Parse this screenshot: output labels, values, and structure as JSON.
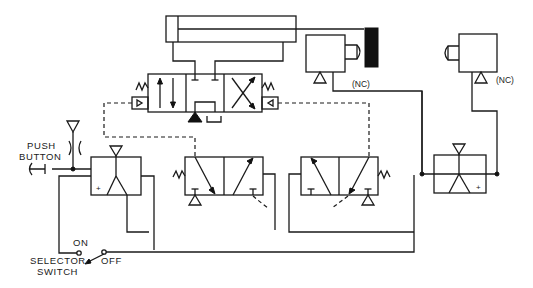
{
  "diagram": {
    "type": "pneumatic-logic-circuit",
    "colors": {
      "line": "#1a1a1a",
      "background": "#ffffff"
    },
    "labels": {
      "push_button_line1": "PUSH",
      "push_button_line2": "BUTTON",
      "selector_line1": "SELECTOR",
      "selector_line2": "SWITCH",
      "selector_on": "ON",
      "selector_off": "OFF",
      "limit_valve_left_nc": "(NC)",
      "limit_valve_right_nc": "(NC)",
      "relay_left_plus": "+",
      "relay_right_plus": "+"
    },
    "components": [
      {
        "id": "cylinder",
        "kind": "double-acting cylinder"
      },
      {
        "id": "main-valve",
        "kind": "4-way 3-position pilot operated valve, spring centered"
      },
      {
        "id": "pilot-valve-left",
        "kind": "3-way 2-position valve, spring return"
      },
      {
        "id": "pilot-valve-right",
        "kind": "3-way 2-position valve, spring return"
      },
      {
        "id": "limit-valve-left",
        "kind": "normally closed limit valve, actuated by cam"
      },
      {
        "id": "limit-valve-right",
        "kind": "normally closed limit valve"
      },
      {
        "id": "relay-left",
        "kind": "logic relay / amplifier"
      },
      {
        "id": "relay-right",
        "kind": "logic relay / amplifier"
      },
      {
        "id": "push-button",
        "kind": "push button sensor"
      },
      {
        "id": "selector-switch",
        "kind": "ON/OFF selector switch"
      }
    ]
  }
}
